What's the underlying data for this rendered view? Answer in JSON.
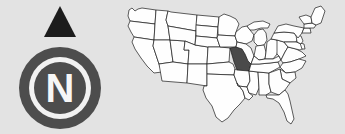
{
  "figure": {
    "name": "locator-map-with-compass-rose",
    "background_color": "#e3e3e3",
    "width": 345,
    "height": 134
  },
  "compass": {
    "name": "compass-rose",
    "cardinal_letter": "N",
    "needle_direction": "north",
    "ring_color": "#4d4d4d",
    "inner_disc_color": "#4d4d4d",
    "gap_color": "#f2f2f2",
    "letter_color": "#f7f7f7",
    "needle_color": "#1c1c1c"
  },
  "map": {
    "name": "united-states-map",
    "region": "Contiguous United States",
    "outline_color": "#1a1a1a",
    "state_fill_color": "#fefefe",
    "highlight_fill_color": "#4a4a4a",
    "highlighted_states": [
      "Missouri"
    ],
    "highlight_label": "Missouri"
  }
}
